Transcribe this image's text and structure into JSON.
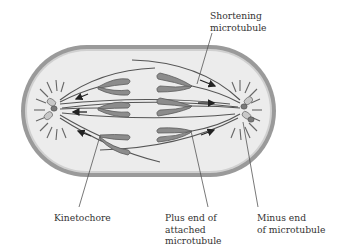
{
  "figure": {
    "labels": {
      "shortening_microtubule": [
        "Shortening",
        "microtubule"
      ],
      "kinetochore": [
        "Kinetochore"
      ],
      "plus_end": [
        "Plus end of",
        "attached",
        "microtubule"
      ],
      "minus_end": [
        "Minus end",
        "of microtubule"
      ]
    },
    "colors": {
      "cell_wall": "#8a8a8a",
      "cell_fill": "#ececec",
      "chromatid": "#8c8c8c",
      "chromatid_outline": "#5a5a5a",
      "microtubule": "#555555",
      "arrow": "#222222",
      "text": "#333333",
      "leader_line": "#555555"
    }
  }
}
